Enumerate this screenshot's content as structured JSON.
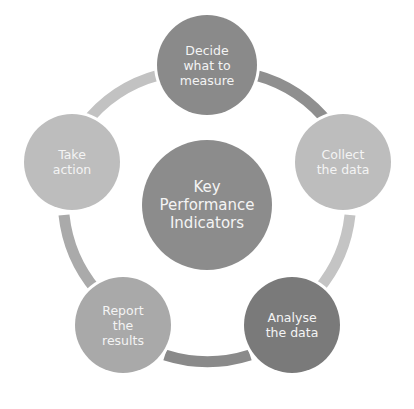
{
  "diagram": {
    "center": {
      "label": "Key\nPerformance\nIndicators",
      "color": "#8c8c8c"
    },
    "steps": [
      {
        "label": "Decide\nwhat to\nmeasure",
        "color": "#8a8a8a"
      },
      {
        "label": "Collect\nthe data",
        "color": "#bdbdbd"
      },
      {
        "label": "Analyse\nthe data",
        "color": "#7a7a7a"
      },
      {
        "label": "Report\nthe\nresults",
        "color": "#a9a9a9"
      },
      {
        "label": "Take\naction",
        "color": "#bdbdbd"
      }
    ],
    "arcs": [
      {
        "from": "Decide what to measure",
        "to": "Collect the data",
        "color": "#8f8f8f"
      },
      {
        "from": "Collect the data",
        "to": "Analyse the data",
        "color": "#c4c4c4"
      },
      {
        "from": "Analyse the data",
        "to": "Report the results",
        "color": "#8a8a8a"
      },
      {
        "from": "Report the results",
        "to": "Take action",
        "color": "#aaaaaa"
      },
      {
        "from": "Take action",
        "to": "Decide what to measure",
        "color": "#c2c2c2"
      }
    ]
  }
}
